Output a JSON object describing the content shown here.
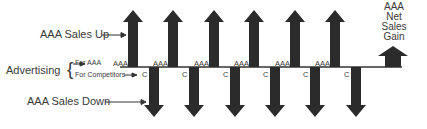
{
  "labels": {
    "sales_up": "AAA Sales Up",
    "advertising": "Advertising",
    "for_aaa": "For AAA",
    "for_competitors": "For Competitors",
    "sales_down": "AAA Sales Down",
    "net_gain_line1": "AAA",
    "net_gain_line2": "Net",
    "net_gain_line3": "Sales",
    "net_gain_line4": "Gain"
  },
  "markers": {
    "aaa": "AAA",
    "competitor": "C"
  },
  "colors": {
    "arrow_fill": "#2b2b2b",
    "line": "#333333",
    "text": "#3a3a3a"
  },
  "cycles": 6
}
